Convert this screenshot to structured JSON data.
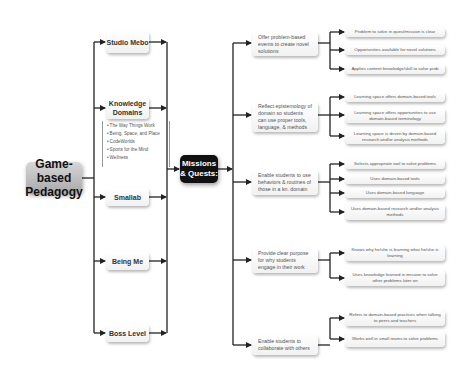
{
  "diagram": {
    "root": {
      "label": "Game-based Pedagogy"
    },
    "components": [
      {
        "label": "Studio Mebo"
      },
      {
        "label": "Knowledge Domains"
      },
      {
        "label": "Smallab"
      },
      {
        "label": "Being Me"
      },
      {
        "label": "Boss Level"
      }
    ],
    "knowledge_domains_list": [
      "The Way Things Work",
      "Being, Space, and Place",
      "CodeWorlds",
      "Sports for the Mind",
      "Wellness"
    ],
    "hub": {
      "label": "Missions & Quests:"
    },
    "goals": [
      {
        "label": "Offer problem-based events to create novel solutions",
        "outcomes": [
          "Problem to solve in quest/mission is clear",
          "Opportunities available for novel solutions",
          "Applies content knowledge/skill to solve prob"
        ]
      },
      {
        "label": "Reflect epistemology of domain so students can use proper tools, language, & methods",
        "outcomes": [
          "Learning space offers domain-based tools",
          "Learning space offers opportunities to use domain-based terminology",
          "Learning space is driven by domain-based research and/or analysis methods"
        ]
      },
      {
        "label": "Enable students to use behaviors & routines of those in a kn. domain",
        "outcomes": [
          "Selects appropriate tool to solve problems",
          "Uses domain-based tools",
          "Uses domain-based language",
          "Uses domain-based research and/or analysis methods"
        ]
      },
      {
        "label": "Provide clear purpose for why students engage in their work",
        "outcomes": [
          "Knows why he/she is learning what he/she is learning",
          "Uses knowledge learned in mission to solve other problems later on"
        ]
      },
      {
        "label": "Enable students to collaborate with others",
        "outcomes": [
          "Refers to domain-based practices when talking to peers and teachers",
          "Works well in small teams to solve problems"
        ]
      }
    ],
    "colors": {
      "line": "#222222",
      "hub": "#111111",
      "root": "#b5b5b5",
      "box": "#f7f7f7"
    }
  }
}
